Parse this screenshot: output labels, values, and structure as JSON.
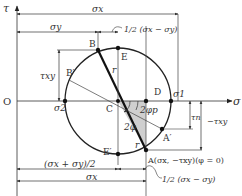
{
  "diagram": {
    "axes": {
      "tau_label": "τ",
      "sigma_label": "σ",
      "origin_label": "O"
    },
    "points": {
      "A": "A(σx, −τxy)(φ = 0)",
      "A_prime": "A′",
      "B": "B",
      "B_prime": "B′",
      "C": "C",
      "D": "D",
      "E": "E",
      "E_prime": "E′"
    },
    "principal": {
      "sigma1": "σ1",
      "sigma2": "σ2"
    },
    "dimensions": {
      "sigma_x": "σx",
      "sigma_y": "σy",
      "half_diff_top": "1/2 (σx − σy)",
      "half_diff_bottom": "1/2 (σx − σy)",
      "mean": "(σx + σy)/2",
      "tau_xy": "τxy",
      "neg_tau_xy": "−τxy",
      "tau_n": "τn"
    },
    "angles": {
      "two_phi": "2φ",
      "two_phi_p": "2φp"
    },
    "radius_label": "r"
  }
}
